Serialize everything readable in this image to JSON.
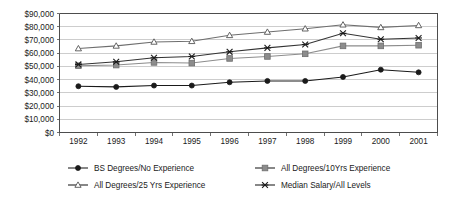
{
  "chart_data": {
    "type": "line",
    "title": "",
    "subtitle": "",
    "xlabel": "",
    "ylabel": "",
    "grid": true,
    "legend_position": "bottom",
    "categories": [
      "1992",
      "1993",
      "1994",
      "1995",
      "1996",
      "1997",
      "1998",
      "1999",
      "2000",
      "2001"
    ],
    "x": [
      1992,
      1993,
      1994,
      1995,
      1996,
      1997,
      1998,
      1999,
      2000,
      2001
    ],
    "ylim": [
      0,
      90000
    ],
    "ytick_values": [
      0,
      10000,
      20000,
      30000,
      40000,
      50000,
      60000,
      70000,
      80000,
      90000
    ],
    "ytick_labels": [
      "$0",
      "$10,000",
      "$20,000",
      "$30,000",
      "$40,000",
      "$50,000",
      "$60,000",
      "$70,000",
      "$80,000",
      "$90,000"
    ],
    "xtick_labels": [
      "1992",
      "1993",
      "1994",
      "1995",
      "1996",
      "1997",
      "1998",
      "1999",
      "2000",
      "2001"
    ],
    "series": [
      {
        "name": "BS Degrees/No Experience",
        "marker": "filled-diamond",
        "color": "#1a1a1a",
        "values": [
          35000,
          34500,
          35500,
          35500,
          38000,
          39000,
          39000,
          42000,
          47500,
          45500
        ]
      },
      {
        "name": "All Degrees/10Yrs Experience",
        "marker": "filled-square",
        "color": "#8c8c8c",
        "values": [
          50500,
          51000,
          53000,
          52500,
          56000,
          57500,
          59500,
          65500,
          65500,
          66000
        ]
      },
      {
        "name": "All Degrees/25 Yrs Experience",
        "marker": "open-triangle",
        "color": "#6e6e6e",
        "values": [
          63500,
          65500,
          68500,
          69000,
          73500,
          76000,
          78500,
          81500,
          79500,
          81000
        ]
      },
      {
        "name": "Median Salary/All Levels",
        "marker": "x-cross",
        "color": "#333333",
        "values": [
          51500,
          53500,
          56500,
          57500,
          61000,
          64000,
          66500,
          75000,
          70500,
          71500
        ]
      }
    ]
  },
  "legend": {
    "entries": [
      {
        "label": "BS Degrees/No Experience",
        "marker": "filled-diamond"
      },
      {
        "label": "All Degrees/10Yrs Experience",
        "marker": "filled-square"
      },
      {
        "label": "All Degrees/25 Yrs Experience",
        "marker": "open-triangle"
      },
      {
        "label": "Median Salary/All Levels",
        "marker": "x-cross"
      }
    ]
  },
  "colors": {
    "background": "#ffffff",
    "gridline": "#b8b8b8",
    "axis": "#4d4d4d",
    "text": "#1a1a1a"
  }
}
